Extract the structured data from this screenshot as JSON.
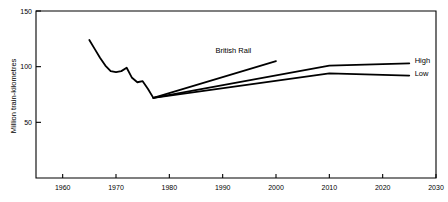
{
  "chart_data": {
    "type": "line",
    "title": "",
    "subtitle": "",
    "xlabel": "",
    "ylabel": "Million train-kilometres",
    "xlim": [
      1960,
      2030
    ],
    "ylim": [
      0,
      150
    ],
    "grid": false,
    "legend_position": "inline-right",
    "x_ticks": [
      1960,
      1970,
      1980,
      1990,
      2000,
      2010,
      2020,
      2030
    ],
    "x_tick_labels": [
      "1960",
      "1970",
      "1980",
      "1990",
      "2000",
      "2010",
      "2020",
      "2030"
    ],
    "y_ticks": [
      50,
      100,
      150
    ],
    "y_tick_labels": [
      "50",
      "100",
      "150"
    ],
    "annotations": [
      {
        "name": "british-rail",
        "text": "British Rail",
        "x": 1992,
        "y": 112
      },
      {
        "name": "high",
        "text": "High",
        "x": 2026,
        "y": 103
      },
      {
        "name": "low",
        "text": "Low",
        "x": 2026,
        "y": 92
      }
    ],
    "series": [
      {
        "name": "Historic",
        "label": "",
        "x": [
          1965,
          1966,
          1967,
          1968,
          1969,
          1970,
          1971,
          1972,
          1973,
          1974,
          1975,
          1976,
          1977
        ],
        "values": [
          124,
          116,
          108,
          101,
          96,
          95,
          96,
          99,
          90,
          86,
          87,
          80,
          72
        ]
      },
      {
        "name": "British Rail",
        "label": "British Rail",
        "x": [
          1977,
          2000
        ],
        "values": [
          72,
          105
        ]
      },
      {
        "name": "High",
        "label": "High",
        "x": [
          1977,
          2010,
          2025
        ],
        "values": [
          72,
          101,
          103
        ]
      },
      {
        "name": "Low",
        "label": "Low",
        "x": [
          1977,
          2010,
          2025
        ],
        "values": [
          72,
          94,
          92
        ]
      }
    ]
  }
}
